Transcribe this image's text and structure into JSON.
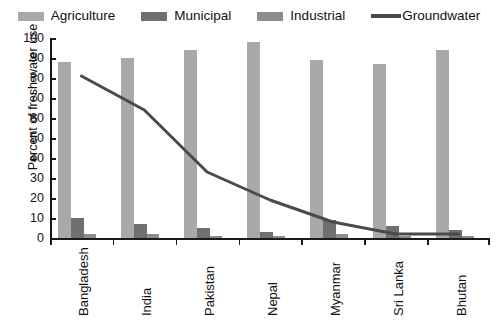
{
  "chart_data": {
    "type": "bar",
    "title": "",
    "xlabel": "",
    "ylabel": "Percent of fresh-water use",
    "ylim": [
      0,
      100
    ],
    "ytick_step": 10,
    "yticks": [
      "100",
      "90",
      "80",
      "70",
      "60",
      "50",
      "40",
      "30",
      "20",
      "10",
      "0"
    ],
    "grid": false,
    "legend_position": "top",
    "categories": [
      "Bangladesh",
      "India",
      "Pakistan",
      "Nepal",
      "Myanmar",
      "Sri Lanka",
      "Bhutan"
    ],
    "series": [
      {
        "name": "Agriculture",
        "kind": "bar",
        "color": "#a9a9a9",
        "values": [
          88,
          90,
          94,
          98,
          89,
          87,
          94
        ]
      },
      {
        "name": "Municipal",
        "kind": "bar",
        "color": "#6f6f6f",
        "values": [
          10,
          7,
          5,
          3,
          9,
          6,
          4
        ]
      },
      {
        "name": "Industrial",
        "kind": "bar",
        "color": "#8d8d8d",
        "values": [
          2,
          2,
          1,
          1,
          2,
          1,
          1
        ]
      },
      {
        "name": "Groundwater",
        "kind": "line",
        "color": "#4a4a4a",
        "values": [
          81,
          64,
          33,
          19,
          8,
          2,
          2
        ]
      }
    ]
  },
  "legend": {
    "items": [
      {
        "label": "Agriculture",
        "marker": "swatch",
        "color": "#a9a9a9"
      },
      {
        "label": "Municipal",
        "marker": "swatch",
        "color": "#6f6f6f"
      },
      {
        "label": "Industrial",
        "marker": "swatch",
        "color": "#8d8d8d"
      },
      {
        "label": "Groundwater",
        "marker": "line",
        "color": "#4a4a4a"
      }
    ]
  }
}
